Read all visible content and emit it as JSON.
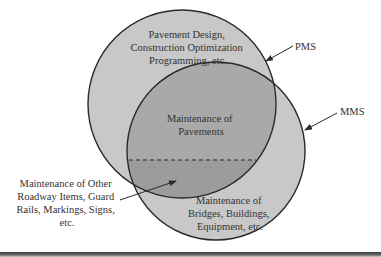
{
  "diagram": {
    "type": "venn",
    "sets": [
      {
        "id": "pms",
        "name": "PMS",
        "description": "Pavement Design, Construction Optimization Programming, etc.",
        "lines": [
          "Pavement Design,",
          "Construction Optimization",
          "Programming, etc."
        ]
      },
      {
        "id": "mms",
        "name": "MMS",
        "description": "Maintenance of Bridges, Buildings, Equipment, etc.",
        "lines": [
          "Maintenance of",
          "Bridges, Buildings,",
          "Equipment, etc."
        ]
      }
    ],
    "overlap": {
      "lines": [
        "Maintenance of",
        "Pavements"
      ]
    },
    "callout": {
      "lines": [
        "Maintenance of Other",
        "Roadway Items, Guard",
        "Rails, Markings, Signs,",
        "etc."
      ]
    },
    "labels": {
      "pms": "PMS",
      "mms": "MMS"
    },
    "colors": {
      "circle_fill": "#c8c8c8",
      "overlap_fill": "#a9a9a9",
      "overlap_lower_fill": "#9c9c9c",
      "stroke": "#2a2a2a",
      "text": "#333333"
    }
  }
}
